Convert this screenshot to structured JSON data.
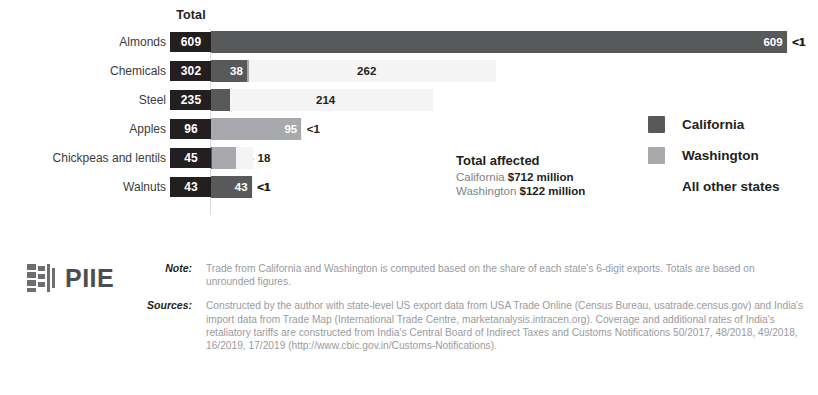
{
  "chart_data": {
    "type": "bar",
    "subtype": "stacked-horizontal",
    "title": "",
    "xlabel": "",
    "ylabel": "",
    "total_column_header": "Total",
    "categories": [
      "Almonds",
      "Chemicals",
      "Steel",
      "Apples",
      "Chickpeas and lentils",
      "Walnuts"
    ],
    "totals": [
      609,
      302,
      235,
      96,
      45,
      43
    ],
    "total_labels": [
      "609",
      "302",
      "235",
      "96",
      "45",
      "43"
    ],
    "series": [
      {
        "name": "California",
        "color": "#58595b",
        "values": [
          609,
          38,
          20,
          0.5,
          1,
          43
        ],
        "labels": [
          "609",
          "38",
          "20",
          "<1",
          "1",
          "43"
        ]
      },
      {
        "name": "Washington",
        "color": "#a7a9ac",
        "values": [
          0.5,
          2,
          0.5,
          95,
          25,
          0.5
        ],
        "labels": [
          "<1",
          "2",
          "<1",
          "95",
          "25",
          "<1"
        ]
      },
      {
        "name": "All other states",
        "color": "#f4f4f4",
        "values": [
          0.5,
          262,
          214,
          0.5,
          18,
          0.5
        ],
        "labels": [
          "<1",
          "262",
          "214",
          "<1",
          "18",
          "<1"
        ]
      }
    ],
    "xlim": [
      0,
      620
    ],
    "grid": false,
    "legend_position": "right",
    "units": "millions of US dollars"
  },
  "legend": {
    "items": [
      {
        "label": "California",
        "color": "#58595b"
      },
      {
        "label": "Washington",
        "color": "#a7a9ac"
      },
      {
        "label": "All other states",
        "color": "#ffffff"
      }
    ]
  },
  "affected": {
    "title": "Total affected",
    "rows": [
      {
        "state": "California",
        "amount": "$712 million"
      },
      {
        "state": "Washington",
        "amount": "$122 million"
      }
    ]
  },
  "footer": {
    "logo_text": "PIIE",
    "note_label": "Note:",
    "note_text": "Trade from California and Washington is computed based on the share of each state's 6-digit exports. Totals are based on unrounded figures.",
    "sources_label": "Sources:",
    "sources_text": "Constructed by the author with state-level US export data from USA Trade Online (Census Bureau, usatrade.census.gov) and India's import data from Trade Map (International Trade Centre, marketanalysis.intracen.org). Coverage and additional rates of India's retaliatory tariffs are constructed from India's Central Board of Indirect Taxes and Customs Notifications 50/2017, 48/2018, 49/2018, 16/2019, 17/2019 (http://www.cbic.gov.in/Customs-Notifications)."
  }
}
